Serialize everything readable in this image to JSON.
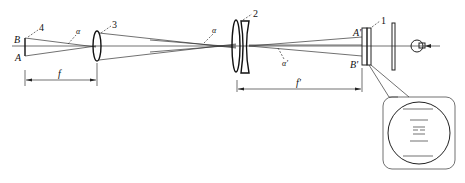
{
  "diagram": {
    "type": "optical-schematic",
    "labels": {
      "object_top": "B",
      "object_bottom": "A",
      "image_top": "A'",
      "image_bottom": "B'",
      "angle_left": "α",
      "angle_mid": "α",
      "angle_right": "α'",
      "focal_left": "f",
      "focal_right": "f'"
    },
    "components": [
      {
        "id": "1",
        "label": "1",
        "name": "reticle-plate"
      },
      {
        "id": "2",
        "label": "2",
        "name": "lens-under-test"
      },
      {
        "id": "3",
        "label": "3",
        "name": "collimator-lens"
      },
      {
        "id": "4",
        "label": "4",
        "name": "object-target"
      }
    ],
    "inset": {
      "description": "magnified view of reticle field",
      "lines": 6
    }
  }
}
